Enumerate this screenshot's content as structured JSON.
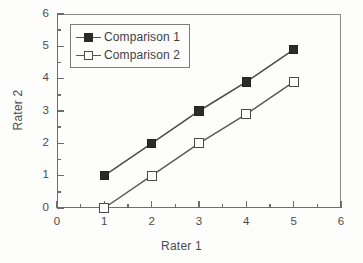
{
  "chart_data": {
    "type": "line",
    "title": "",
    "xlabel": "Rater 1",
    "ylabel": "Rater 2",
    "xlim": [
      0,
      6
    ],
    "ylim": [
      0,
      6
    ],
    "xticks": [
      "0",
      "1",
      "2",
      "3",
      "4",
      "5",
      "6"
    ],
    "yticks": [
      "0",
      "1",
      "2",
      "3",
      "4",
      "5",
      "6"
    ],
    "xtick_values": [
      0,
      1,
      2,
      3,
      4,
      5,
      6
    ],
    "ytick_values": [
      0,
      1,
      2,
      3,
      4,
      5,
      6
    ],
    "minor_tick_interval": 0.5,
    "grid": false,
    "legend_position": "upper left inside",
    "legend_boxed": true,
    "x": [
      1,
      2,
      3,
      4,
      5
    ],
    "series": [
      {
        "name": "Comparison 1",
        "marker": "filled-square",
        "values": [
          1,
          2,
          3,
          3.9,
          4.9
        ]
      },
      {
        "name": "Comparison 2",
        "marker": "open-square",
        "values": [
          0,
          1,
          2,
          2.9,
          3.9
        ]
      }
    ]
  },
  "legend": {
    "items": [
      {
        "label": "Comparison 1",
        "marker": "filled-square"
      },
      {
        "label": "Comparison 2",
        "marker": "open-square"
      }
    ]
  },
  "colors": {
    "series_1": "#2b2b2b",
    "series_2": "#4a4a4a",
    "axis": "#6e6e6e",
    "text": "#4b4b4b",
    "background": "#fdfdfc"
  }
}
